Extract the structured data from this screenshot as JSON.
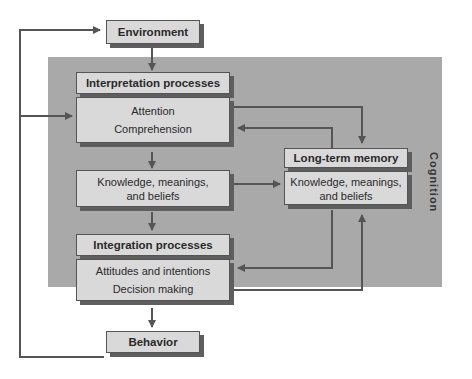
{
  "diagram": {
    "region_label": "Cognition",
    "nodes": {
      "environment": "Environment",
      "interpretation_header": "Interpretation processes",
      "interpretation_items": [
        "Attention",
        "Comprehension"
      ],
      "knowledge": [
        "Knowledge, meanings,",
        "and beliefs"
      ],
      "integration_header": "Integration processes",
      "integration_items": [
        "Attitudes and intentions",
        "Decision making"
      ],
      "ltm_header": "Long-term memory",
      "ltm_body": [
        "Knowledge, meanings,",
        "and  beliefs"
      ],
      "behavior": "Behavior"
    },
    "colors": {
      "panel": "#a9a9a9",
      "box": "#d9d9d9",
      "shadow": "#5e5e5e",
      "line": "#555555"
    }
  }
}
